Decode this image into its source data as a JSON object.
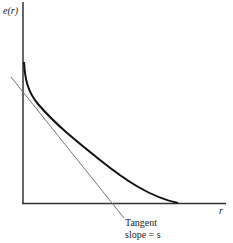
{
  "diagram": {
    "y_axis_label": "e(r)",
    "x_axis_label": "r",
    "annotation_line1": "Tangent",
    "annotation_line2": "slope = s",
    "colors": {
      "curve": "#111111",
      "axes": "#333333",
      "tangent": "#777777"
    }
  }
}
